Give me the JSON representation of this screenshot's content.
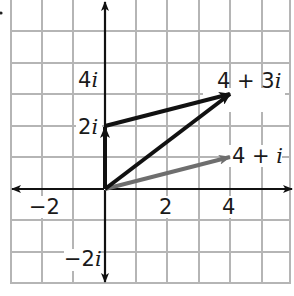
{
  "diagram": {
    "type": "complex-plane",
    "title": "",
    "colors": {
      "grid": "#b5b5b5",
      "axis": "#111111",
      "vector_dark": "#111111",
      "vector_gray": "#6e6e6e",
      "background": "#ffffff"
    },
    "axes": {
      "real_ticks": [
        {
          "value": -2,
          "label": "−2"
        },
        {
          "value": 2,
          "label": "2"
        },
        {
          "value": 4,
          "label": "4"
        }
      ],
      "imag_ticks": [
        {
          "value": 4,
          "label_num": "4",
          "label_i": "i"
        },
        {
          "value": 2,
          "label_num": "2",
          "label_i": "i"
        },
        {
          "value": -2,
          "label_num": "−2",
          "label_i": "i"
        }
      ],
      "real_range": [
        -3,
        6
      ],
      "imag_range": [
        -3,
        6
      ],
      "grid": true,
      "grid_step": 1
    },
    "vectors": [
      {
        "name": "vector-2i",
        "from": [
          0,
          0
        ],
        "to": [
          0,
          2
        ],
        "color": "dark"
      },
      {
        "name": "vector-2i-to-4plus3i",
        "from": [
          0,
          2
        ],
        "to": [
          4,
          3
        ],
        "color": "dark"
      },
      {
        "name": "vector-4plus3i",
        "from": [
          0,
          0
        ],
        "to": [
          4,
          3
        ],
        "color": "dark"
      },
      {
        "name": "vector-4plusi",
        "from": [
          0,
          0
        ],
        "to": [
          4,
          1
        ],
        "color": "gray"
      }
    ],
    "point_labels": {
      "p1": {
        "num": "4 + 3",
        "i": "i"
      },
      "p2": {
        "num": "4 + ",
        "i": "i"
      }
    }
  }
}
